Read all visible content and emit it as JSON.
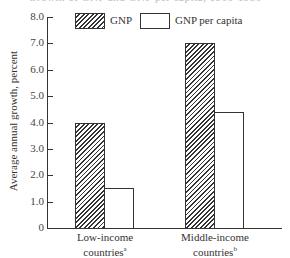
{
  "title_partial": "Growth of GNP and GNP per capita, 1960-1980",
  "legend": [
    {
      "label": "GNP",
      "pattern": "hatched"
    },
    {
      "label": "GNP per capita",
      "pattern": "empty"
    }
  ],
  "axis": {
    "ylabel": "Average annual growth, percent",
    "yticks": [
      "0",
      "1.0",
      "2.0",
      "3.0",
      "4.0",
      "5.0",
      "6.0",
      "7.0",
      "8.0"
    ]
  },
  "groups": [
    {
      "label_line1": "Low-income",
      "label_line2": "countries",
      "footnote": "a"
    },
    {
      "label_line1": "Middle-income",
      "label_line2": "countries",
      "footnote": "b"
    }
  ],
  "chart_data": {
    "type": "bar",
    "title": "",
    "categories": [
      "Low-income countries",
      "Middle-income countries"
    ],
    "series": [
      {
        "name": "GNP",
        "values": [
          4.0,
          7.0
        ]
      },
      {
        "name": "GNP per capita",
        "values": [
          1.5,
          4.4
        ]
      }
    ],
    "xlabel": "",
    "ylabel": "Average annual growth, percent",
    "ylim": [
      0,
      8.0
    ],
    "yticks": [
      0,
      1.0,
      2.0,
      3.0,
      4.0,
      5.0,
      6.0,
      7.0,
      8.0
    ],
    "grid": false,
    "legend_position": "top"
  }
}
